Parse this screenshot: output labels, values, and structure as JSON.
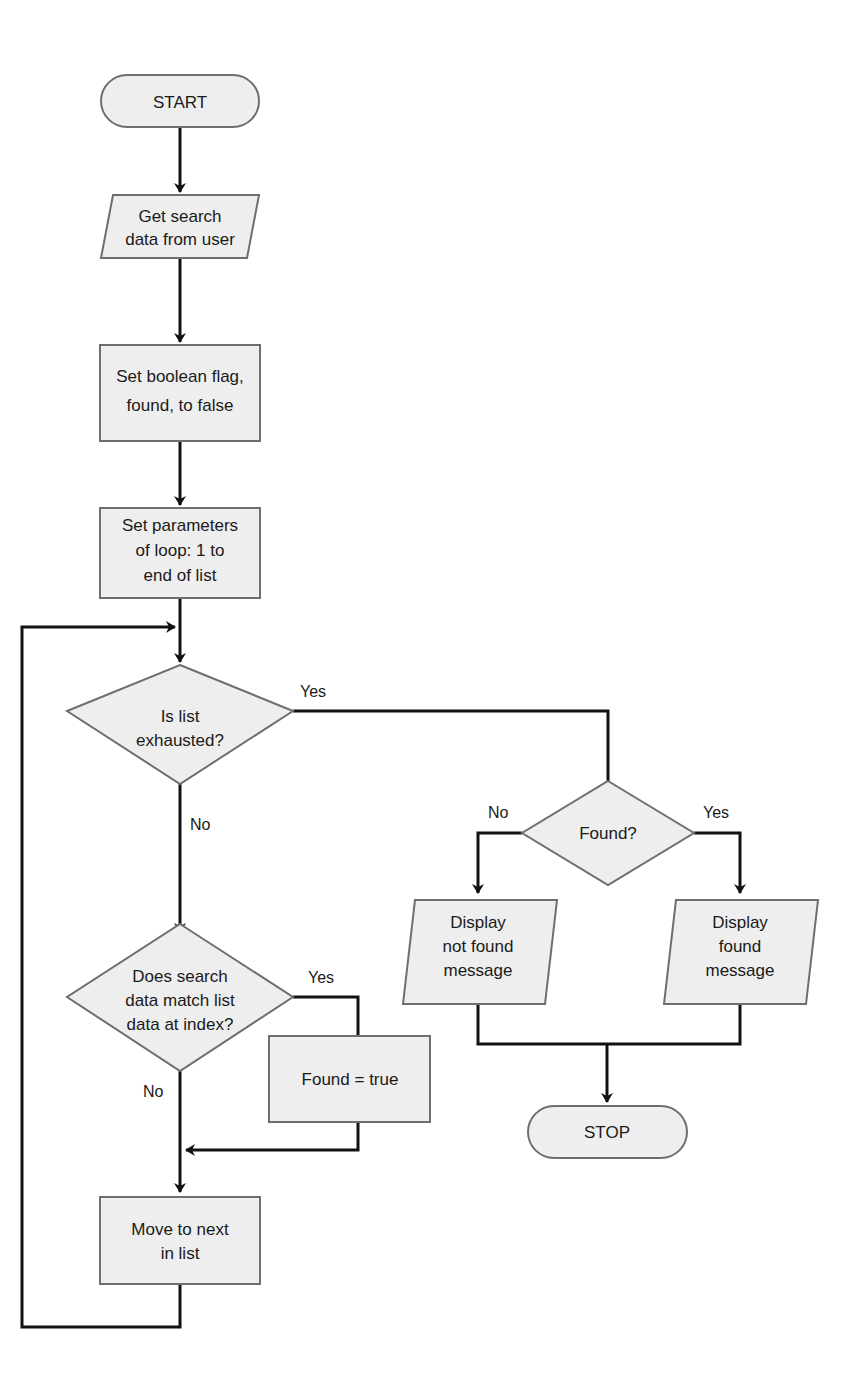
{
  "diagram": {
    "type": "flowchart",
    "colors": {
      "shape_fill": "#eeeeee",
      "shape_stroke": "#6e6e6e",
      "connector": "#111111"
    },
    "nodes": {
      "start": {
        "shape": "terminator",
        "lines": [
          "START"
        ]
      },
      "get_input": {
        "shape": "parallelogram",
        "lines": [
          "Get search",
          "data from user"
        ]
      },
      "set_flag": {
        "shape": "rectangle",
        "lines": [
          "Set boolean flag,",
          "found, to false"
        ]
      },
      "set_loop": {
        "shape": "rectangle",
        "lines": [
          "Set parameters",
          "of loop: 1 to",
          "end of list"
        ]
      },
      "is_exhausted": {
        "shape": "diamond",
        "lines": [
          "Is list",
          "exhausted?"
        ]
      },
      "does_match": {
        "shape": "diamond",
        "lines": [
          "Does search",
          "data match list",
          "data at index?"
        ]
      },
      "found_true": {
        "shape": "rectangle",
        "lines": [
          "Found = true"
        ]
      },
      "move_next": {
        "shape": "rectangle",
        "lines": [
          "Move to next",
          "in list"
        ]
      },
      "found_check": {
        "shape": "diamond",
        "lines": [
          "Found?"
        ]
      },
      "display_not_found": {
        "shape": "parallelogram",
        "lines": [
          "Display",
          "not found",
          "message"
        ]
      },
      "display_found": {
        "shape": "parallelogram",
        "lines": [
          "Display",
          "found",
          "message"
        ]
      },
      "stop": {
        "shape": "terminator",
        "lines": [
          "STOP"
        ]
      }
    },
    "edge_labels": {
      "exhausted_yes": "Yes",
      "exhausted_no": "No",
      "match_yes": "Yes",
      "match_no": "No",
      "found_no": "No",
      "found_yes": "Yes"
    }
  }
}
